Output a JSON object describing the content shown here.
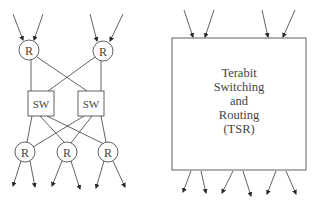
{
  "diagram": {
    "left": {
      "title": "Router and switch network",
      "top_routers": [
        {
          "label": "R",
          "cx": 29,
          "cy": 50
        },
        {
          "label": "R",
          "cx": 103,
          "cy": 51
        }
      ],
      "switches": [
        {
          "label": "SW",
          "x": 28,
          "y": 91,
          "w": 26,
          "h": 25
        },
        {
          "label": "SW",
          "x": 78,
          "y": 91,
          "w": 26,
          "h": 25
        }
      ],
      "bottom_routers": [
        {
          "label": "R",
          "cx": 25,
          "cy": 152
        },
        {
          "label": "R",
          "cx": 67,
          "cy": 152
        },
        {
          "label": "R",
          "cx": 108,
          "cy": 152
        }
      ]
    },
    "right": {
      "title_lines": [
        "Terabit",
        "Switching",
        "and",
        "Routing",
        "(TSR)"
      ],
      "box": {
        "x": 172,
        "y": 38,
        "w": 134,
        "h": 132
      }
    },
    "colors": {
      "stroke": "#3a3a3a",
      "text": "#444444",
      "background": "#ffffff"
    }
  }
}
